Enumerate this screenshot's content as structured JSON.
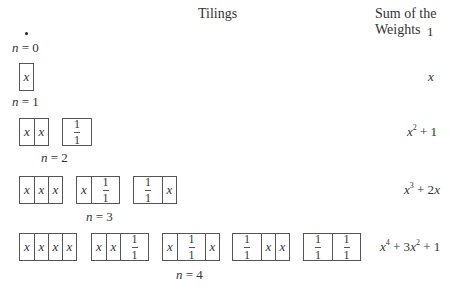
{
  "headers": {
    "tilings": "Tilings",
    "weights": "Sum of the Weights"
  },
  "rows": [
    {
      "n_label": "n = 0",
      "tilings": [],
      "empty_tiling_symbol": "•",
      "weight": "1"
    },
    {
      "n_label": "n = 1",
      "tilings": [
        [
          "x"
        ]
      ],
      "weight": "x"
    },
    {
      "n_label": "n = 2",
      "tilings": [
        [
          "x",
          "x"
        ],
        [
          "1/1"
        ]
      ],
      "weight": "x^2 + 1"
    },
    {
      "n_label": "n = 3",
      "tilings": [
        [
          "x",
          "x",
          "x"
        ],
        [
          "x",
          "1/1"
        ],
        [
          "1/1",
          "x"
        ]
      ],
      "weight": "x^3 + 2x"
    },
    {
      "n_label": "n = 4",
      "tilings": [
        [
          "x",
          "x",
          "x",
          "x"
        ],
        [
          "x",
          "x",
          "1/1"
        ],
        [
          "x",
          "1/1",
          "x"
        ],
        [
          "1/1",
          "x",
          "x"
        ],
        [
          "1/1",
          "1/1"
        ]
      ],
      "weight": "x^4 + 3x^2 + 1"
    }
  ],
  "cell_legend": {
    "square": "x",
    "domino_stacked": "1"
  }
}
